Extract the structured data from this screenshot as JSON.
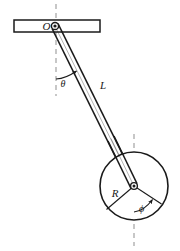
{
  "figure": {
    "type": "physics-diagram",
    "background_color": "#ffffff",
    "line_color": "#1a1a1a",
    "dashed_line_color": "#9a9a9a",
    "width": 180,
    "height": 251
  },
  "labels": {
    "pivot": "O",
    "theta": "θ",
    "rod_length": "L",
    "disk_radius": "R",
    "phi": "ϕ"
  },
  "geometry": {
    "support_bar": {
      "x": 14,
      "y": 20,
      "width": 86,
      "height": 12,
      "description": "horizontal rigid support bar"
    },
    "pivot_point": {
      "x": 55,
      "y": 26,
      "radius": 3.4
    },
    "disk": {
      "cx": 134,
      "cy": 186,
      "r": 34
    },
    "rod": {
      "from_x": 55,
      "from_y": 26,
      "to_x": 134,
      "to_y": 186,
      "half_width": 3.2
    },
    "vertical_dashed_top": {
      "x": 56,
      "y1": 4,
      "y2": 96
    },
    "vertical_dashed_bottom": {
      "x": 134,
      "y1": 134,
      "y2": 246
    },
    "radius_line_left": {
      "x2": 107,
      "y2": 209
    },
    "radius_line_right": {
      "x2": 161,
      "y2": 204
    },
    "theta_label_pos": {
      "x": 63,
      "y": 83
    },
    "L_label_pos": {
      "x": 103,
      "y": 88
    },
    "R_label_pos": {
      "x": 115,
      "y": 194
    },
    "phi_label_pos": {
      "x": 141,
      "y": 208
    }
  }
}
